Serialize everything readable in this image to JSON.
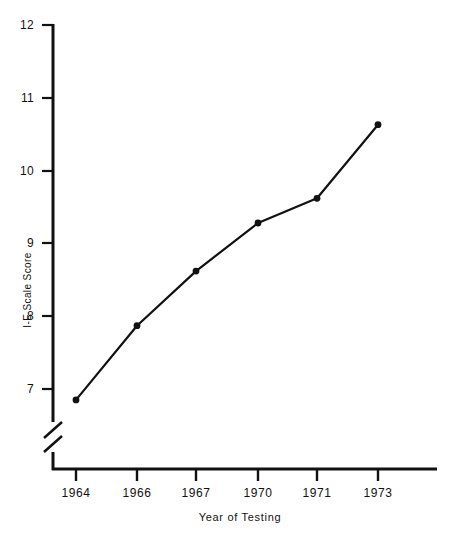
{
  "figure": {
    "background_color": "#ffffff",
    "ink_color": "#111111"
  },
  "chart_data": {
    "type": "line",
    "title": "",
    "subtitle": "",
    "xlabel": "Year  of Testing",
    "ylabel": "I-E Scale Score",
    "categories": [
      "1964",
      "1966",
      "1967",
      "1970",
      "1971",
      "1973"
    ],
    "values": [
      6.85,
      7.87,
      8.62,
      9.28,
      9.62,
      10.63
    ],
    "series": [
      {
        "name": "I-E Scale Score",
        "values": [
          6.85,
          7.87,
          8.62,
          9.28,
          9.62,
          10.63
        ]
      }
    ],
    "ylim": [
      6.5,
      12.15
    ],
    "y_ticks": [
      "7",
      "8",
      "9",
      "10",
      "11",
      "12"
    ],
    "y_tick_values": [
      7,
      8,
      9,
      10,
      11,
      12
    ],
    "x_ticks": [
      "1964",
      "1966",
      "1967",
      "1970",
      "1971",
      "1973"
    ],
    "grid": false,
    "legend": "none",
    "axis_break": {
      "axis": "y",
      "present": true,
      "style": "double-diagonal-slash",
      "position_below_value": 7
    },
    "marker": "filled-circle",
    "line_color": "#111111",
    "marker_color": "#111111"
  }
}
